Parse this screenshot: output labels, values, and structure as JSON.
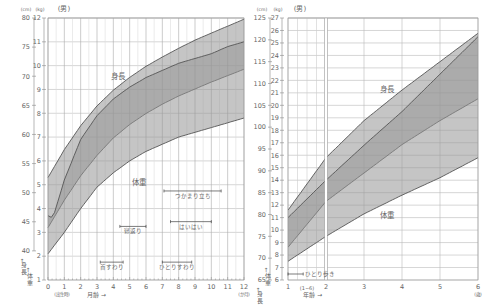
{
  "chart_data": [
    {
      "type": "area",
      "title": "(男)",
      "subject": "Boys growth chart, birth to 12 months (percentile bands 3rd–97th)",
      "xlabel": "月齢 →",
      "x_unit": "(か月)",
      "x_origin_label": "(出生時)",
      "x_ticks": [
        0,
        1,
        2,
        3,
        4,
        5,
        6,
        7,
        8,
        9,
        10,
        11,
        12
      ],
      "xlim": [
        0,
        12
      ],
      "height_axis": {
        "label": "身長",
        "unit": "(cm)",
        "ticks": [
          40,
          45,
          50,
          55,
          60,
          65,
          70,
          75,
          80
        ],
        "ylim": [
          35,
          80
        ]
      },
      "weight_axis": {
        "label": "体重",
        "unit": "(kg)",
        "ticks": [
          1,
          2,
          3,
          4,
          5,
          6,
          7,
          8,
          9,
          10,
          11,
          12
        ],
        "ylim": [
          1,
          12
        ]
      },
      "series": [
        {
          "name": "身長 (upper)",
          "axis": "height",
          "x": [
            0,
            1,
            2,
            3,
            4,
            5,
            6,
            7,
            8,
            9,
            10,
            11,
            12
          ],
          "values": [
            52.6,
            57.4,
            61.5,
            64.9,
            67.6,
            69.8,
            71.7,
            73.3,
            74.8,
            76.2,
            77.4,
            78.6,
            79.8
          ]
        },
        {
          "name": "身長 (lower)",
          "axis": "height",
          "x": [
            0,
            1,
            2,
            3,
            4,
            5,
            6,
            7,
            8,
            9,
            10,
            11,
            12
          ],
          "values": [
            44.0,
            48.7,
            52.9,
            56.4,
            59.4,
            61.7,
            63.6,
            65.2,
            66.6,
            67.8,
            69.0,
            70.1,
            71.2
          ]
        },
        {
          "name": "体重 (upper)",
          "axis": "weight",
          "x": [
            0,
            0.3,
            1,
            2,
            3,
            4,
            5,
            6,
            7,
            8,
            9,
            10,
            11,
            12
          ],
          "values": [
            3.7,
            3.6,
            5.2,
            6.9,
            7.9,
            8.6,
            9.1,
            9.5,
            9.8,
            10.1,
            10.3,
            10.5,
            10.8,
            11.0
          ]
        },
        {
          "name": "体重 (lower)",
          "axis": "weight",
          "x": [
            0,
            1,
            2,
            3,
            4,
            5,
            6,
            7,
            8,
            9,
            10,
            11,
            12
          ],
          "values": [
            2.1,
            3.0,
            4.0,
            4.9,
            5.5,
            6.0,
            6.4,
            6.7,
            7.0,
            7.2,
            7.4,
            7.6,
            7.8
          ]
        }
      ],
      "annotations": [
        {
          "label": "つかまり立ち",
          "from": 7.1,
          "to": 10.6
        },
        {
          "label": "はいはい",
          "from": 7.5,
          "to": 10.0
        },
        {
          "label": "寝返り",
          "from": 4.4,
          "to": 6.0
        },
        {
          "label": "首すわり",
          "from": 3.2,
          "to": 4.6
        },
        {
          "label": "ひとりすわり",
          "from": 7.0,
          "to": 8.8
        }
      ],
      "band_labels": {
        "height": "身長",
        "weight": "体重"
      },
      "grid": true
    },
    {
      "type": "area",
      "title": "(男)",
      "subject": "Boys growth chart, 1 to 6 years (percentile bands 3rd–97th)",
      "xlabel": "年齢 →",
      "x_unit": "(歳)",
      "x_sub_label": "(1~6)",
      "x_ticks": [
        1,
        2,
        3,
        4,
        5,
        6
      ],
      "xlim": [
        1,
        6
      ],
      "height_axis": {
        "label": "身長",
        "unit": "(cm)",
        "ticks": [
          65,
          70,
          75,
          80,
          85,
          90,
          95,
          100,
          105,
          110,
          115,
          120,
          125
        ],
        "ylim": [
          65,
          125
        ]
      },
      "weight_axis": {
        "label": "体重",
        "unit": "(kg)",
        "ticks": [
          6,
          7,
          8,
          9,
          10,
          11,
          12,
          13,
          14,
          15,
          16,
          17,
          18,
          19,
          20,
          21,
          22,
          23,
          24,
          25,
          26,
          27
        ],
        "ylim": [
          6,
          27
        ]
      },
      "series": [
        {
          "name": "身長 (upper)",
          "axis": "height",
          "x": [
            1,
            2,
            3,
            4,
            5,
            6
          ],
          "values": [
            81.0,
            93.0,
            101.5,
            108.5,
            115.0,
            121.5
          ]
        },
        {
          "name": "身長 (lower)",
          "axis": "height",
          "x": [
            1,
            2,
            3,
            4,
            5,
            6
          ],
          "values": [
            72.5,
            83.0,
            89.5,
            96.0,
            101.5,
            106.5
          ]
        },
        {
          "name": "体重 (upper)",
          "axis": "weight",
          "x": [
            1,
            2,
            3,
            4,
            5,
            6
          ],
          "values": [
            11.0,
            14.0,
            16.8,
            19.5,
            22.5,
            25.5
          ]
        },
        {
          "name": "体重 (lower)",
          "axis": "weight",
          "x": [
            1,
            2,
            3,
            4,
            5,
            6
          ],
          "values": [
            7.5,
            9.5,
            11.3,
            12.8,
            14.2,
            15.8
          ]
        }
      ],
      "annotations": [
        {
          "label": "ひとり歩き",
          "from": 1.0,
          "to": 1.4
        }
      ],
      "band_labels": {
        "height": "身長",
        "weight": "体重"
      },
      "grid": true
    }
  ]
}
